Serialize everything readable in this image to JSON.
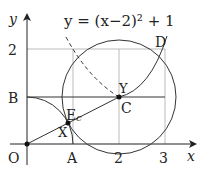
{
  "diagram": {
    "equation": "y = (x−2)² + 1",
    "axes": {
      "x_label": "x",
      "y_label": "y",
      "origin_label": "O"
    },
    "x_ticks": [
      "A",
      "2",
      "3"
    ],
    "y_ticks": [
      "2",
      "B"
    ],
    "points": {
      "O": "O",
      "A": "A",
      "B": "B",
      "C": "C",
      "D": "D",
      "E": "E",
      "X": "X",
      "Y": "Y",
      "c": "c"
    }
  }
}
